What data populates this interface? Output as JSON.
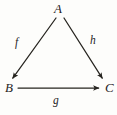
{
  "figure": {
    "kind": "commutative-triangle-diagram",
    "background_color": "#fdfdfb",
    "ink_color": "#26241f",
    "width": 117,
    "height": 115
  },
  "nodes": [
    {
      "id": "A",
      "label": "A",
      "x": 59,
      "y": 9
    },
    {
      "id": "B",
      "label": "B",
      "x": 11,
      "y": 88
    },
    {
      "id": "C",
      "label": "C",
      "x": 110,
      "y": 88
    }
  ],
  "edges": [
    {
      "id": "f",
      "label": "f",
      "from": "A",
      "to": "B",
      "label_x": 18,
      "label_y": 43,
      "start_x": 56,
      "start_y": 18,
      "end_x": 12,
      "end_y": 79,
      "arrowhead": "end"
    },
    {
      "id": "g",
      "label": "g",
      "from": "B",
      "to": "C",
      "label_x": 57,
      "label_y": 101,
      "start_x": 18,
      "start_y": 88,
      "end_x": 99,
      "end_y": 88,
      "arrowhead": "end"
    },
    {
      "id": "h",
      "label": "h",
      "from": "A",
      "to": "C",
      "label_x": 94,
      "label_y": 41,
      "start_x": 64,
      "start_y": 18,
      "end_x": 103,
      "end_y": 79,
      "arrowhead": "end"
    }
  ]
}
